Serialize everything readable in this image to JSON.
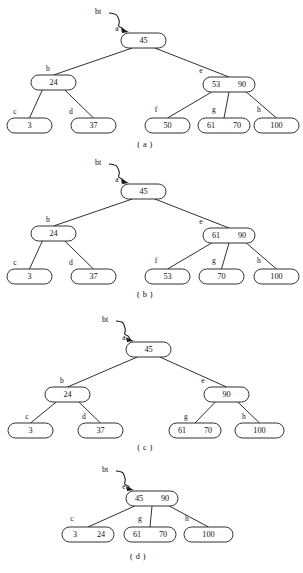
{
  "figure": {
    "pointer_label": "bt",
    "panels": [
      {
        "id": "a",
        "caption": "( a )",
        "caption_x": 145,
        "caption_y": 145,
        "pointer": {
          "label": "bt",
          "label_x": 98,
          "label_y": 12
        },
        "nodes": [
          {
            "key": "a",
            "label": "a",
            "label_x": 117,
            "label_y": 29,
            "x": 121,
            "y": 33,
            "w": 45,
            "h": 15,
            "values": [
              "45"
            ]
          },
          {
            "key": "b",
            "label": "b",
            "label_x": 48,
            "label_y": 69,
            "x": 31,
            "y": 75,
            "w": 45,
            "h": 15,
            "values": [
              "24"
            ]
          },
          {
            "key": "e",
            "label": "e",
            "label_x": 201,
            "label_y": 71,
            "x": 203,
            "y": 77,
            "w": 52,
            "h": 15,
            "values": [
              "53",
              "90"
            ]
          },
          {
            "key": "c",
            "label": "c",
            "label_x": 15,
            "label_y": 112,
            "x": 7,
            "y": 118,
            "w": 45,
            "h": 15,
            "values": [
              "3"
            ]
          },
          {
            "key": "d",
            "label": "d",
            "label_x": 71,
            "label_y": 112,
            "x": 71,
            "y": 118,
            "w": 45,
            "h": 15,
            "values": [
              "37"
            ]
          },
          {
            "key": "f",
            "label": "f",
            "label_x": 156,
            "label_y": 110,
            "x": 145,
            "y": 118,
            "w": 45,
            "h": 15,
            "values": [
              "50"
            ]
          },
          {
            "key": "g",
            "label": "g",
            "label_x": 214,
            "label_y": 110,
            "x": 198,
            "y": 118,
            "w": 52,
            "h": 15,
            "values": [
              "61",
              "70"
            ]
          },
          {
            "key": "h",
            "label": "h",
            "label_x": 259,
            "label_y": 110,
            "x": 254,
            "y": 118,
            "w": 45,
            "h": 15,
            "values": [
              "100"
            ]
          }
        ],
        "edges": [
          {
            "from": "a",
            "to": "b"
          },
          {
            "from": "a",
            "to": "e"
          },
          {
            "from": "b",
            "to": "c"
          },
          {
            "from": "b",
            "to": "d"
          },
          {
            "from": "e",
            "to": "f"
          },
          {
            "from": "e",
            "to": "g"
          },
          {
            "from": "e",
            "to": "h"
          }
        ]
      },
      {
        "id": "b",
        "caption": "( b )",
        "caption_x": 145,
        "caption_y": 295,
        "pointer": {
          "label": "bt",
          "label_x": 98,
          "label_y": 163
        },
        "nodes": [
          {
            "key": "a",
            "label": "a",
            "label_x": 117,
            "label_y": 180,
            "x": 121,
            "y": 184,
            "w": 45,
            "h": 15,
            "values": [
              "45"
            ]
          },
          {
            "key": "b",
            "label": "b",
            "label_x": 48,
            "label_y": 220,
            "x": 31,
            "y": 226,
            "w": 45,
            "h": 15,
            "values": [
              "24"
            ]
          },
          {
            "key": "e",
            "label": "e",
            "label_x": 201,
            "label_y": 222,
            "x": 203,
            "y": 228,
            "w": 52,
            "h": 15,
            "values": [
              "61",
              "90"
            ]
          },
          {
            "key": "c",
            "label": "c",
            "label_x": 15,
            "label_y": 263,
            "x": 7,
            "y": 269,
            "w": 45,
            "h": 15,
            "values": [
              "3"
            ]
          },
          {
            "key": "d",
            "label": "d",
            "label_x": 71,
            "label_y": 263,
            "x": 71,
            "y": 269,
            "w": 45,
            "h": 15,
            "values": [
              "37"
            ]
          },
          {
            "key": "f",
            "label": "f",
            "label_x": 156,
            "label_y": 261,
            "x": 145,
            "y": 269,
            "w": 45,
            "h": 15,
            "values": [
              "53"
            ]
          },
          {
            "key": "g",
            "label": "g",
            "label_x": 214,
            "label_y": 261,
            "x": 199,
            "y": 269,
            "w": 45,
            "h": 15,
            "values": [
              "70"
            ]
          },
          {
            "key": "h",
            "label": "h",
            "label_x": 259,
            "label_y": 261,
            "x": 254,
            "y": 269,
            "w": 45,
            "h": 15,
            "values": [
              "100"
            ]
          }
        ],
        "edges": [
          {
            "from": "a",
            "to": "b"
          },
          {
            "from": "a",
            "to": "e"
          },
          {
            "from": "b",
            "to": "c"
          },
          {
            "from": "b",
            "to": "d"
          },
          {
            "from": "e",
            "to": "f"
          },
          {
            "from": "e",
            "to": "g"
          },
          {
            "from": "e",
            "to": "h"
          }
        ]
      },
      {
        "id": "c",
        "caption": "( c )",
        "caption_x": 145,
        "caption_y": 448,
        "pointer": {
          "label": "bt",
          "label_x": 105,
          "label_y": 320
        },
        "nodes": [
          {
            "key": "a",
            "label": "a",
            "label_x": 124,
            "label_y": 338,
            "x": 126,
            "y": 342,
            "w": 45,
            "h": 15,
            "values": [
              "45"
            ]
          },
          {
            "key": "b",
            "label": "b",
            "label_x": 62,
            "label_y": 381,
            "x": 45,
            "y": 387,
            "w": 45,
            "h": 15,
            "values": [
              "24"
            ]
          },
          {
            "key": "e",
            "label": "e",
            "label_x": 203,
            "label_y": 381,
            "x": 204,
            "y": 387,
            "w": 45,
            "h": 15,
            "values": [
              "90"
            ]
          },
          {
            "key": "c",
            "label": "c",
            "label_x": 27,
            "label_y": 417,
            "x": 8,
            "y": 423,
            "w": 45,
            "h": 15,
            "values": [
              "3"
            ]
          },
          {
            "key": "d",
            "label": "d",
            "label_x": 84,
            "label_y": 417,
            "x": 78,
            "y": 423,
            "w": 45,
            "h": 15,
            "values": [
              "37"
            ]
          },
          {
            "key": "g",
            "label": "g",
            "label_x": 186,
            "label_y": 417,
            "x": 169,
            "y": 423,
            "w": 52,
            "h": 15,
            "values": [
              "61",
              "70"
            ]
          },
          {
            "key": "h",
            "label": "h",
            "label_x": 244,
            "label_y": 417,
            "x": 235,
            "y": 423,
            "w": 49,
            "h": 15,
            "values": [
              "100"
            ]
          }
        ],
        "edges": [
          {
            "from": "a",
            "to": "b"
          },
          {
            "from": "a",
            "to": "e"
          },
          {
            "from": "b",
            "to": "c"
          },
          {
            "from": "b",
            "to": "d"
          },
          {
            "from": "e",
            "to": "g"
          },
          {
            "from": "e",
            "to": "h"
          }
        ]
      },
      {
        "id": "d",
        "caption": "( d )",
        "caption_x": 138,
        "caption_y": 557,
        "pointer": {
          "label": "bt",
          "label_x": 105,
          "label_y": 470
        },
        "nodes": [
          {
            "key": "e",
            "label": "e",
            "label_x": 124,
            "label_y": 487,
            "x": 126,
            "y": 491,
            "w": 52,
            "h": 15,
            "values": [
              "45",
              "90"
            ]
          },
          {
            "key": "c",
            "label": "c",
            "label_x": 72,
            "label_y": 519,
            "x": 62,
            "y": 527,
            "w": 52,
            "h": 15,
            "values": [
              "3",
              "24"
            ]
          },
          {
            "key": "g",
            "label": "g",
            "label_x": 140,
            "label_y": 519,
            "x": 124,
            "y": 527,
            "w": 52,
            "h": 15,
            "values": [
              "61",
              "70"
            ]
          },
          {
            "key": "h",
            "label": "h",
            "label_x": 187,
            "label_y": 519,
            "x": 184,
            "y": 527,
            "w": 49,
            "h": 15,
            "values": [
              "100"
            ]
          }
        ],
        "edges": [
          {
            "from": "e",
            "to": "c"
          },
          {
            "from": "e",
            "to": "g"
          },
          {
            "from": "e",
            "to": "h"
          }
        ]
      }
    ]
  },
  "colors": {
    "stroke": "#1a1a1a",
    "text": "#111111",
    "background": "#ffffff"
  }
}
